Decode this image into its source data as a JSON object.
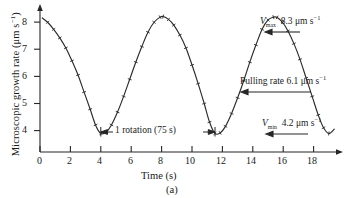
{
  "figure": {
    "caption": "(a)",
    "xlabel": "Time (s)",
    "ylabel_text": "Microscopic growth rate (μm s",
    "ylabel_exp": "−1",
    "ylabel_close": ")"
  },
  "annotations": {
    "vmax": {
      "symbol": "V",
      "sub": "max",
      "value": "8.3 μm s",
      "exp": "−1",
      "arrow": "left-arrow-icon"
    },
    "pulling": {
      "label": "Pulling rate 6.1 μm s",
      "exp": "−1",
      "arrow": "left-arrow-icon"
    },
    "vmin": {
      "symbol": "V",
      "sub": "min",
      "value": "4.2 μm s",
      "exp": "−1",
      "arrow": "left-arrow-icon"
    },
    "rotation": {
      "label": "1 rotation (75 s)",
      "arrow": "double-headed-arrow-icon"
    }
  },
  "chart_data": {
    "type": "line",
    "title": "",
    "xlabel": "Time (s)",
    "ylabel": "Microscopic growth rate (μm s⁻¹)",
    "xlim": [
      0,
      19.6
    ],
    "ylim": [
      3.55,
      8.6
    ],
    "xticks": [
      0,
      2,
      4,
      6,
      8,
      10,
      12,
      14,
      16,
      18
    ],
    "yticks": [
      4,
      5,
      6,
      7,
      8
    ],
    "grid": false,
    "legend": null,
    "markers": "small tick marks along curve",
    "reference_values": {
      "V_max": 8.3,
      "V_min": 4.2,
      "pulling_rate": 6.1,
      "period_rotation_s": 7.5
    },
    "x": [
      0.15,
      0.5,
      0.9,
      1.3,
      1.7,
      2.1,
      2.5,
      2.9,
      3.3,
      3.65,
      4.0,
      4.35,
      4.7,
      5.1,
      5.5,
      5.9,
      6.3,
      6.7,
      7.1,
      7.5,
      7.9,
      8.1,
      8.45,
      8.8,
      9.2,
      9.6,
      10.0,
      10.4,
      10.8,
      11.15,
      11.5,
      11.85,
      12.2,
      12.6,
      13.0,
      13.4,
      13.8,
      14.2,
      14.6,
      15.0,
      15.35,
      15.6,
      15.95,
      16.3,
      16.7,
      17.1,
      17.5,
      17.9,
      18.3,
      18.65,
      19.0,
      19.35
    ],
    "y": [
      8.25,
      8.1,
      7.85,
      7.55,
      7.2,
      6.75,
      6.25,
      5.65,
      5.05,
      4.5,
      4.2,
      4.25,
      4.5,
      4.95,
      5.5,
      6.1,
      6.7,
      7.25,
      7.75,
      8.1,
      8.28,
      8.3,
      8.2,
      8.0,
      7.65,
      7.2,
      6.6,
      5.95,
      5.25,
      4.6,
      4.2,
      4.22,
      4.45,
      4.9,
      5.45,
      6.05,
      6.7,
      7.3,
      7.85,
      8.18,
      8.28,
      8.27,
      8.1,
      7.8,
      7.35,
      6.8,
      6.15,
      5.5,
      4.85,
      4.4,
      4.2,
      4.35
    ],
    "series": [
      {
        "name": "Microscopic growth rate",
        "x": [
          0.15,
          0.5,
          0.9,
          1.3,
          1.7,
          2.1,
          2.5,
          2.9,
          3.3,
          3.65,
          4.0,
          4.35,
          4.7,
          5.1,
          5.5,
          5.9,
          6.3,
          6.7,
          7.1,
          7.5,
          7.9,
          8.1,
          8.45,
          8.8,
          9.2,
          9.6,
          10.0,
          10.4,
          10.8,
          11.15,
          11.5,
          11.85,
          12.2,
          12.6,
          13.0,
          13.4,
          13.8,
          14.2,
          14.6,
          15.0,
          15.35,
          15.6,
          15.95,
          16.3,
          16.7,
          17.1,
          17.5,
          17.9,
          18.3,
          18.65,
          19.0,
          19.35
        ],
        "values": [
          8.25,
          8.1,
          7.85,
          7.55,
          7.2,
          6.75,
          6.25,
          5.65,
          5.05,
          4.5,
          4.2,
          4.25,
          4.5,
          4.95,
          5.5,
          6.1,
          6.7,
          7.25,
          7.75,
          8.1,
          8.28,
          8.3,
          8.2,
          8.0,
          7.65,
          7.2,
          6.6,
          5.95,
          5.25,
          4.6,
          4.2,
          4.22,
          4.45,
          4.9,
          5.45,
          6.05,
          6.7,
          7.3,
          7.85,
          8.18,
          8.28,
          8.27,
          8.1,
          7.8,
          7.35,
          6.8,
          6.15,
          5.5,
          4.85,
          4.4,
          4.2,
          4.35
        ]
      }
    ]
  }
}
